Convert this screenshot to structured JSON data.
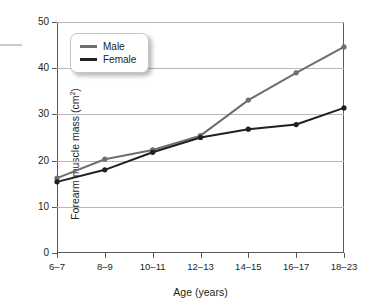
{
  "chart_data": {
    "type": "line",
    "title": "",
    "xlabel": "Age (years)",
    "ylabel": "Forearm muscle mass (cm²)",
    "ylabel_main": "Forearm muscle mass (cm",
    "ylabel_sup": "2",
    "ylabel_close": ")",
    "categories": [
      "6–7",
      "8–9",
      "10–11",
      "12–13",
      "14–15",
      "16–17",
      "18–23"
    ],
    "ylim": [
      0,
      50
    ],
    "yticks": [
      0,
      10,
      20,
      30,
      40,
      50
    ],
    "ytick_labels": [
      "0",
      "10",
      "20",
      "30",
      "40",
      "50"
    ],
    "grid": true,
    "legend_position": "top-left-inside",
    "series": [
      {
        "name": "Male",
        "color": "#6d6e70",
        "values": [
          16.2,
          20.3,
          22.3,
          25.4,
          33.1,
          39.0,
          44.6
        ]
      },
      {
        "name": "Female",
        "color": "#231f20",
        "values": [
          15.4,
          18.0,
          21.8,
          25.0,
          26.8,
          27.8,
          31.4
        ]
      }
    ]
  },
  "legend": {
    "items": [
      {
        "label": "Male"
      },
      {
        "label": "Female"
      }
    ]
  },
  "colors": {
    "male": "#6d6e70",
    "female": "#231f20",
    "axis": "#58595b",
    "grid": "#b9b9b9",
    "background": "#ffffff"
  }
}
